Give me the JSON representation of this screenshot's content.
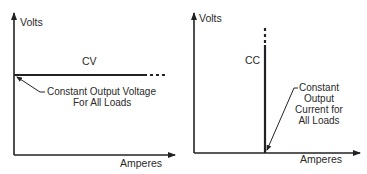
{
  "diagram": {
    "left_panel": {
      "y_axis_label": "Volts",
      "x_axis_label": "Amperes",
      "mode_label": "CV",
      "annotation": [
        "Constant Output Voltage",
        "For All Loads"
      ]
    },
    "right_panel": {
      "y_axis_label": "Volts",
      "x_axis_label": "Amperes",
      "mode_label": "CC",
      "annotation": [
        "Constant",
        "Output",
        "Current for",
        "All Loads"
      ]
    },
    "colors": {
      "line": "#222222",
      "text": "#2a2a2a",
      "background": "#ffffff"
    }
  }
}
